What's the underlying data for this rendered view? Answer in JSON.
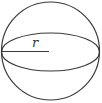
{
  "diagram": {
    "radius_label": "r",
    "stroke_color": "#3a3a3a",
    "background": "#ffffff",
    "elements": [
      "outer-circle",
      "equator-ellipse",
      "radius-line"
    ]
  }
}
